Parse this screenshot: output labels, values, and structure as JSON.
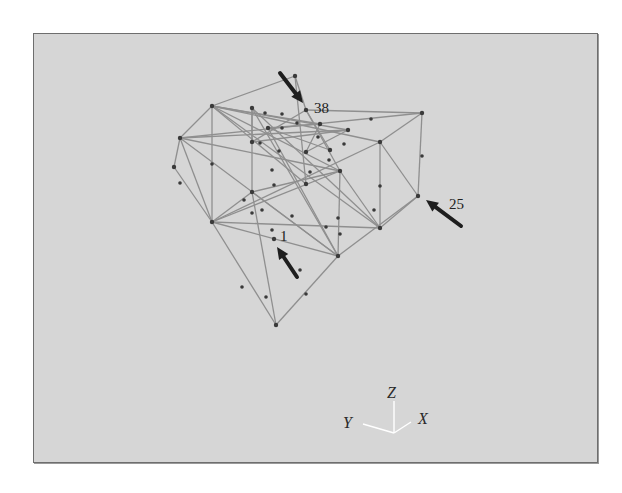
{
  "figure": {
    "type": "3d-truss-wireframe",
    "colors": {
      "panel": "#d6d6d6",
      "border": "#6e6e6e",
      "member": "#8f8f8f",
      "node": "#3a3a3a",
      "arrow": "#1e1e1e",
      "axis": "#ffffff"
    },
    "nodes": {
      "apex": [
        295,
        76
      ],
      "n38": [
        306,
        110
      ],
      "ul": [
        212,
        106
      ],
      "lm": [
        180,
        138
      ],
      "fl": [
        174,
        167
      ],
      "bl": [
        212,
        222
      ],
      "ur": [
        422,
        113
      ],
      "rm": [
        380,
        142
      ],
      "n25": [
        418,
        196
      ],
      "lr": [
        380,
        228
      ],
      "cr": [
        340,
        171
      ],
      "cb": [
        338,
        256
      ],
      "n1": [
        274,
        239
      ],
      "bot": [
        276,
        325
      ],
      "mli": [
        252,
        192
      ],
      "ctr": [
        306,
        184
      ],
      "t1": [
        252,
        108
      ],
      "t2": [
        320,
        124
      ],
      "t3": [
        348,
        130
      ],
      "t4": [
        268,
        128
      ],
      "t5": [
        306,
        152
      ],
      "t6": [
        252,
        142
      ],
      "t7": [
        330,
        150
      ]
    },
    "members": [
      [
        "apex",
        "ul"
      ],
      [
        "apex",
        "n38"
      ],
      [
        "apex",
        "ctr"
      ],
      [
        "ul",
        "lm"
      ],
      [
        "lm",
        "fl"
      ],
      [
        "fl",
        "bl"
      ],
      [
        "lm",
        "bl"
      ],
      [
        "ul",
        "bl"
      ],
      [
        "ul",
        "t2"
      ],
      [
        "ul",
        "cr"
      ],
      [
        "ul",
        "ctr"
      ],
      [
        "ul",
        "t3"
      ],
      [
        "ul",
        "rm"
      ],
      [
        "lm",
        "t3"
      ],
      [
        "lm",
        "ur"
      ],
      [
        "lm",
        "cb"
      ],
      [
        "lm",
        "cr"
      ],
      [
        "n38",
        "ur"
      ],
      [
        "n38",
        "cr"
      ],
      [
        "n38",
        "t6"
      ],
      [
        "n38",
        "t7"
      ],
      [
        "ur",
        "rm"
      ],
      [
        "ur",
        "n25"
      ],
      [
        "rm",
        "lr"
      ],
      [
        "rm",
        "n25"
      ],
      [
        "rm",
        "bl"
      ],
      [
        "n25",
        "lr"
      ],
      [
        "n25",
        "cb"
      ],
      [
        "cr",
        "cb"
      ],
      [
        "cr",
        "lr"
      ],
      [
        "cr",
        "bl"
      ],
      [
        "cr",
        "mli"
      ],
      [
        "lr",
        "bl"
      ],
      [
        "lr",
        "ul"
      ],
      [
        "lr",
        "t1"
      ],
      [
        "cb",
        "bl"
      ],
      [
        "cb",
        "bot"
      ],
      [
        "cb",
        "t1"
      ],
      [
        "cb",
        "t4"
      ],
      [
        "bl",
        "bot"
      ],
      [
        "bl",
        "mli"
      ],
      [
        "mli",
        "t1"
      ],
      [
        "mli",
        "bot"
      ],
      [
        "mli",
        "cb"
      ],
      [
        "t1",
        "t6"
      ],
      [
        "t4",
        "t2"
      ],
      [
        "t4",
        "t7"
      ],
      [
        "t5",
        "t3"
      ],
      [
        "t6",
        "t3"
      ],
      [
        "t2",
        "t5"
      ]
    ],
    "mid_nodes": [
      [
        180,
        183
      ],
      [
        212,
        164
      ],
      [
        242,
        287
      ],
      [
        306,
        294
      ],
      [
        266,
        297
      ],
      [
        252,
        213
      ],
      [
        272,
        170
      ],
      [
        292,
        216
      ],
      [
        326,
        227
      ],
      [
        274,
        185
      ],
      [
        244,
        200
      ],
      [
        262,
        210
      ],
      [
        338,
        218
      ],
      [
        374,
        210
      ],
      [
        300,
        270
      ],
      [
        340,
        234
      ],
      [
        272,
        230
      ],
      [
        422,
        156
      ],
      [
        371,
        119
      ],
      [
        380,
        186
      ],
      [
        282,
        114
      ],
      [
        297,
        123
      ],
      [
        318,
        137
      ],
      [
        282,
        128
      ],
      [
        260,
        143
      ],
      [
        279,
        151
      ],
      [
        310,
        172
      ],
      [
        329,
        160
      ],
      [
        344,
        144
      ],
      [
        265,
        113
      ]
    ],
    "annotations": [
      {
        "label": "38",
        "node": "n38",
        "text_pos": [
          314,
          108
        ],
        "arrow_from": [
          280,
          73
        ],
        "arrow_to": [
          303,
          103
        ]
      },
      {
        "label": "25",
        "node": "n25",
        "text_pos": [
          449,
          204
        ],
        "arrow_from": [
          461,
          226
        ],
        "arrow_to": [
          426,
          200
        ]
      },
      {
        "label": "1",
        "node": "n1",
        "text_pos": [
          280,
          236
        ],
        "arrow_from": [
          297,
          277
        ],
        "arrow_to": [
          277,
          247
        ]
      }
    ],
    "axes": {
      "origin": [
        394,
        433
      ],
      "z_end": [
        394,
        401
      ],
      "y_end": [
        363,
        424
      ],
      "x_end": [
        411,
        422
      ],
      "labels": {
        "z": "Z",
        "y": "Y",
        "x": "X"
      },
      "label_pos": {
        "z": [
          387,
          398
        ],
        "y": [
          343,
          428
        ],
        "x": [
          418,
          424
        ]
      }
    }
  }
}
